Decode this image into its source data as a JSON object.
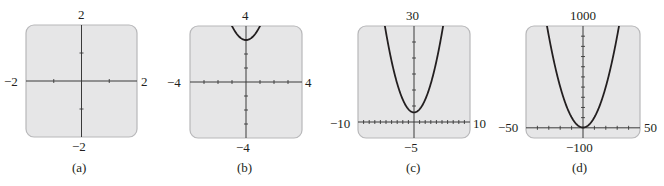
{
  "figure": {
    "style": {
      "panel_fill": "#e6e6e7",
      "panel_border": "#b8b8ba",
      "axis_color": "#3a3a3a",
      "curve_color": "#231f20"
    }
  },
  "chart_data": [
    {
      "type": "line",
      "caption": "(a)",
      "function": "y = x^2 + 3",
      "xlim": [
        -2,
        2
      ],
      "ylim": [
        -2,
        2
      ],
      "x_tick_step": 1,
      "y_tick_step": 1,
      "labels": {
        "xmin": "−2",
        "xmax": "2",
        "ymin": "−2",
        "ymax": "2"
      },
      "box": {
        "x": 26,
        "y": 25,
        "w": 111,
        "h": 112
      },
      "curve_visible": false,
      "grid": false
    },
    {
      "type": "line",
      "caption": "(b)",
      "function": "y = x^2 + 3",
      "xlim": [
        -4,
        4
      ],
      "ylim": [
        -4,
        4
      ],
      "x_tick_step": 1,
      "y_tick_step": 1,
      "labels": {
        "xmin": "−4",
        "xmax": "4",
        "ymin": "−4",
        "ymax": "4"
      },
      "box": {
        "x": 190,
        "y": 26,
        "w": 112,
        "h": 112
      },
      "curve_visible": true,
      "grid": false
    },
    {
      "type": "line",
      "caption": "(c)",
      "function": "y = x^2 + 3",
      "xlim": [
        -10,
        10
      ],
      "ylim": [
        -5,
        30
      ],
      "x_tick_step": 1,
      "y_tick_step": 5,
      "labels": {
        "xmin": "−10",
        "xmax": "10",
        "ymin": "−5",
        "ymax": "30"
      },
      "box": {
        "x": 358,
        "y": 26,
        "w": 112,
        "h": 112
      },
      "curve_visible": true,
      "grid": false
    },
    {
      "type": "line",
      "caption": "(d)",
      "function": "y = x^2 + 3",
      "xlim": [
        -50,
        50
      ],
      "ylim": [
        -100,
        1000
      ],
      "x_tick_step": 10,
      "y_tick_step": 100,
      "labels": {
        "xmin": "−50",
        "xmax": "50",
        "ymin": "−100",
        "ymax": "1000"
      },
      "box": {
        "x": 526,
        "y": 26,
        "w": 114,
        "h": 112
      },
      "curve_visible": true,
      "grid": false
    }
  ]
}
